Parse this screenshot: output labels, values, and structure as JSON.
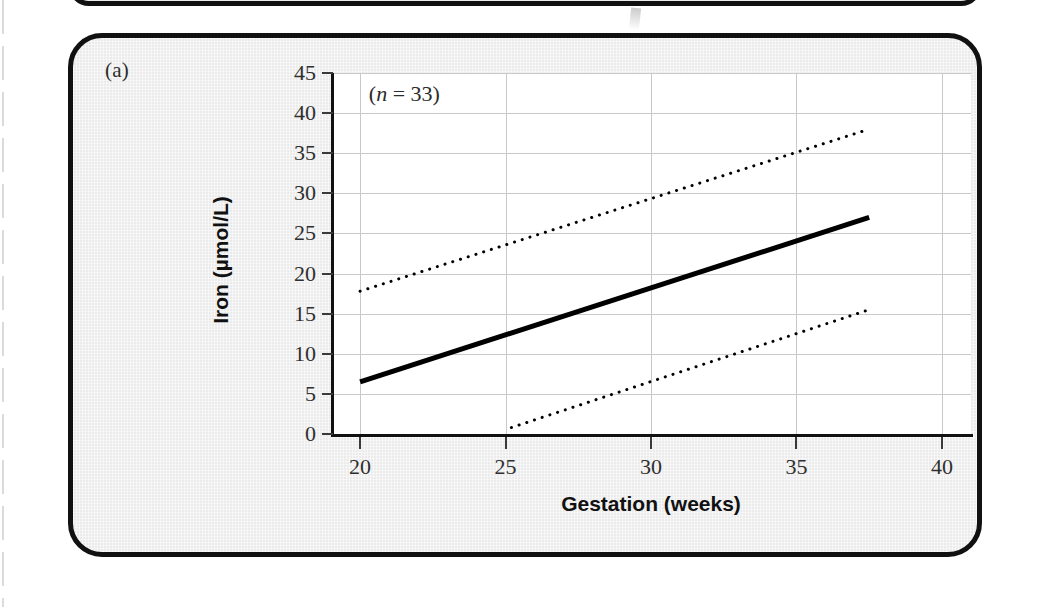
{
  "panel": {
    "letter": "(a)",
    "annotation": "(n = 33)",
    "annotation_prefix": "(",
    "annotation_symbol": "n",
    "annotation_suffix": " = 33)"
  },
  "colors": {
    "panel_background": "#ebebeb",
    "panel_border": "#111111",
    "plot_background": "#ffffff",
    "gridline": "#c9c9c9",
    "axis": "#111111",
    "regression_line": "#000000",
    "confidence_line": "#000000"
  },
  "chart_data": {
    "type": "line",
    "title": "",
    "subtitle": "",
    "xlabel": "Gestation (weeks)",
    "ylabel": "Iron (µmol/L)",
    "xlim": [
      19,
      41
    ],
    "ylim": [
      0,
      45
    ],
    "xticks": [
      20,
      25,
      30,
      35,
      40
    ],
    "yticks": [
      0,
      5,
      10,
      15,
      20,
      25,
      30,
      35,
      40,
      45
    ],
    "xtick_labels": [
      "20",
      "25",
      "30",
      "35",
      "40"
    ],
    "ytick_labels": [
      "0",
      "5",
      "10",
      "15",
      "20",
      "25",
      "30",
      "35",
      "40",
      "45"
    ],
    "grid": true,
    "grid_axes": "both",
    "legend": false,
    "legend_position": "none",
    "annotations": [
      {
        "text": "(n = 33)",
        "x": 20.3,
        "y": 42.0
      }
    ],
    "series": [
      {
        "name": "Regression line",
        "style": "solid",
        "width": 5,
        "x": [
          20.0,
          37.5
        ],
        "y": [
          6.5,
          27.0
        ]
      },
      {
        "name": "Upper 95% confidence limit",
        "style": "dotted",
        "width": 3,
        "x": [
          20.0,
          37.5
        ],
        "y": [
          17.8,
          38.0
        ]
      },
      {
        "name": "Lower 95% confidence limit",
        "style": "dotted",
        "width": 3,
        "x": [
          25.2,
          37.5
        ],
        "y": [
          0.8,
          15.5
        ]
      }
    ]
  }
}
